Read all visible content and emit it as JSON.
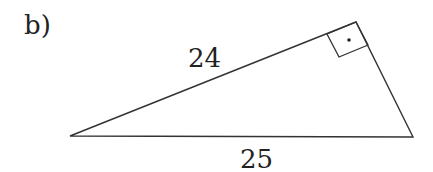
{
  "part_label": "b)",
  "triangle": {
    "type": "right triangle",
    "right_angle_marker": "square with dot",
    "sides": {
      "leg_labeled": "24",
      "hypotenuse": "25",
      "other_leg": ""
    },
    "colors": {
      "stroke": "#333333",
      "background": "#ffffff"
    }
  }
}
